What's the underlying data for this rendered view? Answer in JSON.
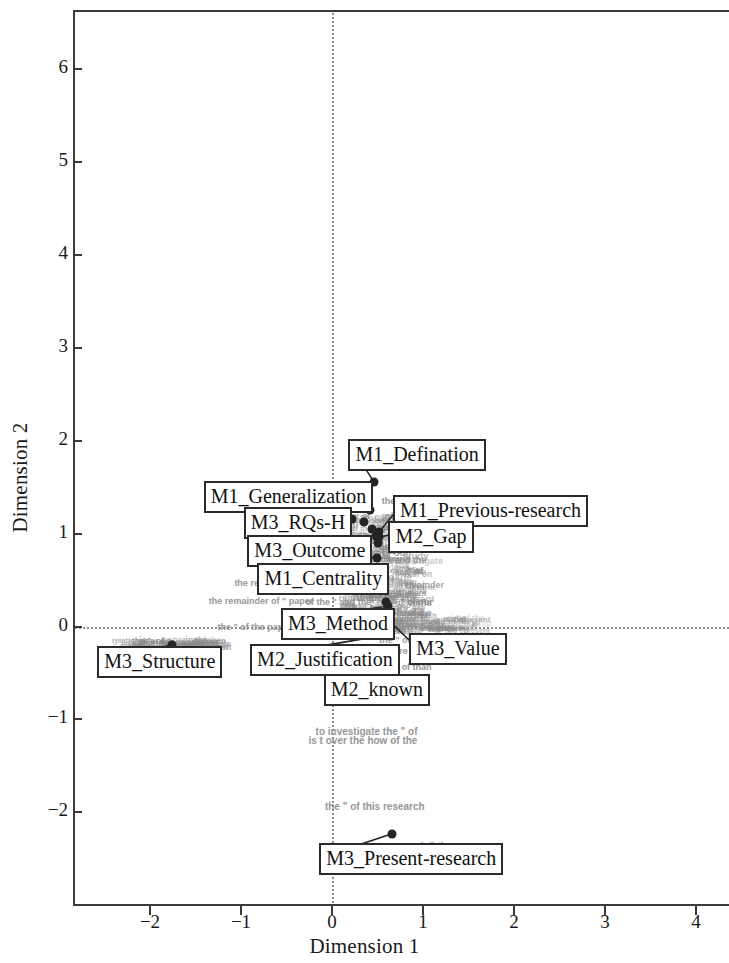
{
  "chart_data": {
    "type": "scatter",
    "title": "",
    "xlabel": "Dimension 1",
    "ylabel": "Dimension 2",
    "xlim": [
      -2.83,
      4.38
    ],
    "ylim": [
      -2.68,
      6.45
    ],
    "xticks": [
      -2,
      -1,
      0,
      1,
      2,
      3,
      4
    ],
    "xticklabels": [
      "−2",
      "−1",
      "0",
      "1",
      "2",
      "3",
      "4"
    ],
    "yticks": [
      -2,
      -1,
      0,
      1,
      2,
      3,
      4,
      5,
      6
    ],
    "yticklabels": [
      "−2",
      "−1",
      "0",
      "1",
      "2",
      "3",
      "4",
      "5",
      "6"
    ],
    "grid": false,
    "legend": "none",
    "reference_lines": [
      {
        "axis": "x",
        "value": 0,
        "style": "dotted"
      },
      {
        "axis": "y",
        "value": 0,
        "style": "dotted"
      }
    ],
    "labeled_points": [
      {
        "label": "M1_Defination",
        "x": 0.46,
        "y": 1.56,
        "box_x": 0.18,
        "box_y": 1.88
      },
      {
        "label": "M1_Generalization",
        "x": 0.42,
        "y": 1.25,
        "box_x": -1.41,
        "box_y": 1.43
      },
      {
        "label": "M1_Previous-research",
        "x": 0.52,
        "y": 1.02,
        "box_x": 0.67,
        "box_y": 1.28
      },
      {
        "label": "M3_RQs-H",
        "x": 0.22,
        "y": 1.16,
        "box_x": -0.97,
        "box_y": 1.15
      },
      {
        "label": "M2_Gap",
        "x": 0.52,
        "y": 0.96,
        "box_x": 0.62,
        "box_y": 1.0
      },
      {
        "label": "M3_Outcome",
        "x": 0.49,
        "y": 0.74,
        "box_x": -0.93,
        "box_y": 0.85
      },
      {
        "label": "M1_Centrality",
        "x": 0.48,
        "y": 0.53,
        "box_x": -0.82,
        "box_y": 0.54
      },
      {
        "label": "M3_Method",
        "x": 0.62,
        "y": 0.22,
        "box_x": -0.56,
        "box_y": 0.06
      },
      {
        "label": "M3_Value",
        "x": 0.64,
        "y": 0.05,
        "box_x": 0.85,
        "box_y": -0.21
      },
      {
        "label": "M2_Justification",
        "x": 0.6,
        "y": -0.09,
        "box_x": -0.9,
        "box_y": -0.33
      },
      {
        "label": "M2_known",
        "x": 0.67,
        "y": -0.4,
        "box_x": -0.09,
        "box_y": -0.65
      },
      {
        "label": "M3_Structure",
        "x": -1.76,
        "y": -0.2,
        "box_x": -2.58,
        "box_y": -0.35
      },
      {
        "label": "M3_Present-research",
        "x": 0.66,
        "y": -2.23,
        "box_x": -0.14,
        "box_y": -2.47
      }
    ],
    "cluster_points": [
      {
        "x": 0.22,
        "y": 1.16
      },
      {
        "x": 0.35,
        "y": 1.13
      },
      {
        "x": 0.42,
        "y": 1.25
      },
      {
        "x": 0.46,
        "y": 1.56
      },
      {
        "x": 0.44,
        "y": 1.05
      },
      {
        "x": 0.52,
        "y": 1.02
      },
      {
        "x": 0.48,
        "y": 0.97
      },
      {
        "x": 0.52,
        "y": 0.96
      },
      {
        "x": 0.5,
        "y": 0.9
      },
      {
        "x": 0.49,
        "y": 0.74
      },
      {
        "x": 0.51,
        "y": 0.62
      },
      {
        "x": 0.48,
        "y": 0.53
      },
      {
        "x": 0.55,
        "y": 0.44
      },
      {
        "x": 0.62,
        "y": 0.22
      },
      {
        "x": 0.59,
        "y": 0.26
      },
      {
        "x": 0.64,
        "y": 0.05
      },
      {
        "x": 0.6,
        "y": -0.09
      },
      {
        "x": 0.67,
        "y": -0.4
      },
      {
        "x": -1.76,
        "y": -0.2
      },
      {
        "x": 0.66,
        "y": -2.23
      }
    ],
    "faint_text_annotations": [
      {
        "text": "the remainder of \" paper",
        "x": -0.78,
        "y": 0.27,
        "size": 9
      },
      {
        "text": "of the \" and the",
        "x": 0.07,
        "y": 0.26,
        "size": 9
      },
      {
        "text": "\" of our",
        "x": 0.93,
        "y": 0.26,
        "size": 9
      },
      {
        "text": "the \" of the paper",
        "x": -0.85,
        "y": 0.0,
        "size": 9
      },
      {
        "text": "of a",
        "x": 0.92,
        "y": 0.16,
        "size": 9
      },
      {
        "text": "the relationship between \" half on",
        "x": -0.28,
        "y": 0.47,
        "size": 9
      },
      {
        "text": "and the",
        "x": 0.86,
        "y": 0.72,
        "size": 9
      },
      {
        "text": "\" of",
        "x": 0.92,
        "y": 0.6,
        "size": 9
      },
      {
        "text": "is",
        "x": 0.82,
        "y": 1.32,
        "size": 9
      },
      {
        "text": "the",
        "x": 0.62,
        "y": 1.35,
        "size": 9
      },
      {
        "text": "Gap",
        "x": 0.87,
        "y": 1.18,
        "size": 9
      },
      {
        "text": "the \" of the",
        "x": 0.78,
        "y": -0.14,
        "size": 9
      },
      {
        "text": "re on",
        "x": 0.86,
        "y": -0.26,
        "size": 9
      },
      {
        "text": "of than",
        "x": 0.93,
        "y": -0.44,
        "size": 9
      },
      {
        "text": "to investigate the \" of",
        "x": 0.38,
        "y": -1.12,
        "size": 10
      },
      {
        "text": "is t over the how of the",
        "x": 0.34,
        "y": -1.22,
        "size": 10
      },
      {
        "text": "the \" of this research",
        "x": 0.47,
        "y": -1.93,
        "size": 10
      },
      {
        "text": "the present research \" the",
        "x": 0.64,
        "y": -2.36,
        "size": 10
      }
    ]
  },
  "figure": {
    "point_color": "#242424",
    "label_border_color": "#2a2a2a",
    "reference_line_color": "#8d8d8d",
    "cloud_text_color": "#8c8c8c",
    "axis_color": "#3a3a3a"
  }
}
